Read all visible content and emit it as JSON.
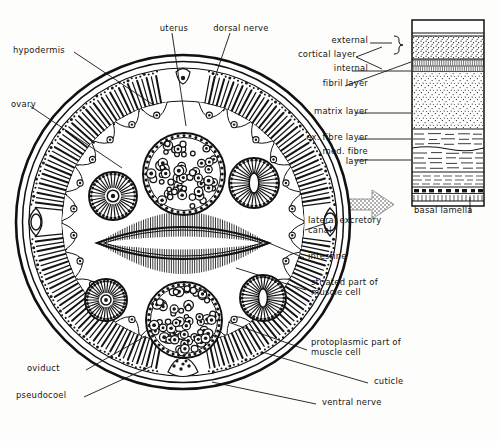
{
  "figure": {
    "ink": "#121212",
    "paper": "#fdfdfb",
    "arrow_fill": "#9a9a9a"
  },
  "labels": {
    "hypodermis": "hypodermis",
    "ovary": "ovary",
    "uterus": "uterus",
    "dorsal_nerve": "dorsal nerve",
    "oviduct": "oviduct",
    "pseudocoel": "pseudocoel",
    "ventral_nerve": "ventral nerve",
    "cuticle": "cuticle",
    "protoplasmic": "protoplasmic part of\nmuscle cell",
    "striated": "striated part of\nmuscle cell",
    "intestine": "intestine",
    "lateral_canal": "lateral excretory\ncanal",
    "basal_lamella": "basal lamella"
  },
  "cuticle_panel": {
    "bracket_label": "cortical layer",
    "layers": [
      {
        "name": "external",
        "texture": "blank"
      },
      {
        "name": "internal",
        "texture": "stipple"
      },
      {
        "name": "fibril layer",
        "texture": "fibril"
      },
      {
        "name": "matrix layer",
        "texture": "stipple"
      },
      {
        "name": "ex. fibre layer",
        "texture": "dash"
      },
      {
        "name": "med. fibre\nlayer",
        "texture": "dash"
      },
      {
        "name": "",
        "texture": "dash-fine"
      },
      {
        "name": "basal lamella",
        "texture": "blocks"
      }
    ]
  }
}
